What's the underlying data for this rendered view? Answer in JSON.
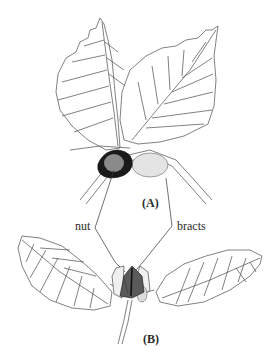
{
  "figure": {
    "panels": [
      {
        "id": "A",
        "label": "(A)",
        "description": "Beech twig with leaves and fruit; nut partly enclosed by bracts"
      },
      {
        "id": "B",
        "label": "(B)",
        "description": "Beech shoot with leaves and young fruit enclosed by bracts"
      }
    ],
    "callouts": {
      "nut": "nut",
      "bracts": "bracts"
    },
    "colors": {
      "line": "#3a3a3a",
      "nut_dark": "#1a1a1a",
      "nut_center": "#8a8a8a",
      "bract_shade": "#cfcfcf",
      "background": "#ffffff"
    }
  }
}
